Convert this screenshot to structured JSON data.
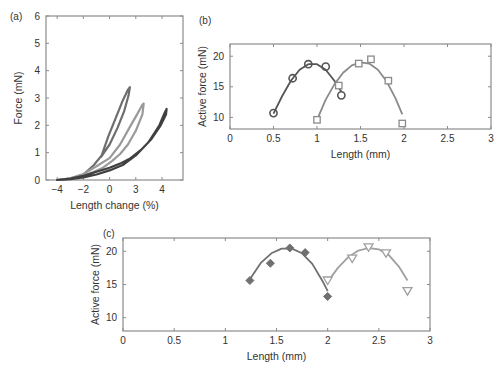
{
  "figure": {
    "panels": [
      {
        "label": "(a)"
      },
      {
        "label": "(b)"
      },
      {
        "label": "(c)"
      }
    ]
  },
  "chart_data": [
    {
      "panel": "(a)",
      "type": "line",
      "title": "",
      "xlabel": "Length change (%)",
      "ylabel": "Force (mN)",
      "xlim": [
        -4.85,
        5.6
      ],
      "ylim": [
        0,
        6
      ],
      "xticks": [
        -4,
        -2,
        0,
        2,
        4
      ],
      "xtick_labels": [
        "-4",
        "-2",
        "0",
        "3",
        "4"
      ],
      "yticks": [
        0,
        1,
        2,
        3,
        4,
        5,
        6
      ],
      "ytick_labels": [
        "0",
        "1",
        "2",
        "3",
        "4",
        "5",
        "6"
      ],
      "grid": false,
      "legend": null,
      "series": [
        {
          "name": "loop 1",
          "color": "#6e6e6e",
          "points": [
            [
              -4,
              0
            ],
            [
              -3,
              0.05
            ],
            [
              -2,
              0.2
            ],
            [
              -1.2,
              0.55
            ],
            [
              -0.6,
              0.9
            ],
            [
              -0.1,
              1.6
            ],
            [
              0.5,
              2.3
            ],
            [
              1.0,
              2.9
            ],
            [
              1.4,
              3.3
            ],
            [
              1.55,
              3.4
            ],
            [
              1.45,
              3.1
            ],
            [
              1.1,
              2.5
            ],
            [
              0.6,
              1.9
            ],
            [
              0.0,
              1.3
            ],
            [
              -0.5,
              0.95
            ],
            [
              -0.65,
              0.85
            ]
          ]
        },
        {
          "name": "loop 2",
          "color": "#9a9a9a",
          "points": [
            [
              -4,
              0
            ],
            [
              -3,
              0.06
            ],
            [
              -2,
              0.22
            ],
            [
              -1,
              0.5
            ],
            [
              0,
              0.8
            ],
            [
              0.8,
              1.3
            ],
            [
              1.5,
              1.9
            ],
            [
              2.1,
              2.4
            ],
            [
              2.5,
              2.75
            ],
            [
              2.6,
              2.8
            ],
            [
              2.5,
              2.4
            ],
            [
              2.0,
              1.8
            ],
            [
              1.4,
              1.3
            ],
            [
              0.8,
              0.95
            ],
            [
              0.2,
              0.7
            ],
            [
              -0.5,
              0.45
            ],
            [
              -1.2,
              0.3
            ],
            [
              -2,
              0.15
            ],
            [
              -3,
              0.05
            ],
            [
              -4,
              0
            ]
          ]
        },
        {
          "name": "loop 3",
          "color": "#404040",
          "points": [
            [
              -4,
              0
            ],
            [
              -3,
              0.03
            ],
            [
              -2,
              0.1
            ],
            [
              -1,
              0.2
            ],
            [
              0,
              0.35
            ],
            [
              1,
              0.55
            ],
            [
              2,
              0.9
            ],
            [
              3,
              1.4
            ],
            [
              3.8,
              2.0
            ],
            [
              4.2,
              2.45
            ],
            [
              4.35,
              2.6
            ],
            [
              4.3,
              2.4
            ],
            [
              3.9,
              2.0
            ],
            [
              3.2,
              1.5
            ],
            [
              2.4,
              1.1
            ],
            [
              1.6,
              0.8
            ],
            [
              0.8,
              0.6
            ],
            [
              0,
              0.45
            ],
            [
              -1,
              0.3
            ],
            [
              -2,
              0.15
            ],
            [
              -3,
              0.05
            ],
            [
              -4,
              0
            ]
          ]
        }
      ]
    },
    {
      "panel": "(b)",
      "type": "scatter",
      "title": "",
      "xlabel": "Length (mm)",
      "ylabel": "Active force (mN)",
      "xlim": [
        0,
        3
      ],
      "ylim": [
        8.1,
        22.0
      ],
      "xticks": [
        0,
        0.5,
        1,
        1.5,
        2,
        2.5,
        3
      ],
      "xtick_labels": [
        "0",
        "0.5",
        "1",
        "1.5",
        "2",
        "2.5",
        "3"
      ],
      "yticks": [
        10,
        15,
        20
      ],
      "ytick_labels": [
        "10",
        "15",
        "20"
      ],
      "grid": false,
      "legend": null,
      "series": [
        {
          "name": "circles",
          "marker": "circle",
          "color": "#555555",
          "x": [
            0.5,
            0.72,
            0.9,
            1.1,
            1.28
          ],
          "y": [
            10.7,
            16.4,
            18.7,
            18.3,
            13.6
          ],
          "fit": [
            [
              0.5,
              10.6
            ],
            [
              0.6,
              13.5
            ],
            [
              0.7,
              16.0
            ],
            [
              0.8,
              17.8
            ],
            [
              0.9,
              18.7
            ],
            [
              1.0,
              18.7
            ],
            [
              1.1,
              17.8
            ],
            [
              1.2,
              16.0
            ],
            [
              1.28,
              14.2
            ]
          ]
        },
        {
          "name": "squares",
          "marker": "square",
          "color": "#8a8a8a",
          "x": [
            1.0,
            1.25,
            1.48,
            1.62,
            1.82,
            1.98
          ],
          "y": [
            9.6,
            15.2,
            18.8,
            19.5,
            16.0,
            9.0
          ],
          "fit": [
            [
              1.0,
              9.6
            ],
            [
              1.1,
              12.9
            ],
            [
              1.2,
              15.4
            ],
            [
              1.3,
              17.3
            ],
            [
              1.4,
              18.5
            ],
            [
              1.5,
              19.0
            ],
            [
              1.6,
              18.8
            ],
            [
              1.7,
              17.8
            ],
            [
              1.8,
              15.9
            ],
            [
              1.9,
              13.2
            ],
            [
              1.98,
              10.5
            ]
          ]
        }
      ]
    },
    {
      "panel": "(c)",
      "type": "scatter",
      "title": "",
      "xlabel": "Length (mm)",
      "ylabel": "Active force (mN)",
      "xlim": [
        0,
        3
      ],
      "ylim": [
        8.0,
        22.0
      ],
      "xticks": [
        0,
        0.5,
        1,
        1.5,
        2,
        2.5,
        3
      ],
      "xtick_labels": [
        "0",
        "0.5",
        "1",
        "1.5",
        "2",
        "2.5",
        "3"
      ],
      "yticks": [
        10,
        15,
        20
      ],
      "ytick_labels": [
        "10",
        "15",
        "20"
      ],
      "grid": false,
      "legend": null,
      "series": [
        {
          "name": "diamonds",
          "marker": "diamond",
          "color": "#707070",
          "x": [
            1.24,
            1.44,
            1.63,
            1.78,
            2.0
          ],
          "y": [
            15.6,
            18.2,
            20.5,
            19.8,
            13.2
          ],
          "fit": [
            [
              1.24,
              15.8
            ],
            [
              1.35,
              18.3
            ],
            [
              1.45,
              19.7
            ],
            [
              1.55,
              20.4
            ],
            [
              1.65,
              20.4
            ],
            [
              1.75,
              19.7
            ],
            [
              1.85,
              18.1
            ],
            [
              1.95,
              15.5
            ],
            [
              2.0,
              14.0
            ]
          ]
        },
        {
          "name": "triangles",
          "marker": "triangle-down",
          "color": "#a0a0a0",
          "x": [
            2.0,
            2.24,
            2.4,
            2.57,
            2.78
          ],
          "y": [
            15.6,
            18.9,
            20.6,
            19.7,
            14.0
          ],
          "fit": [
            [
              2.0,
              15.4
            ],
            [
              2.1,
              17.5
            ],
            [
              2.2,
              19.1
            ],
            [
              2.3,
              20.1
            ],
            [
              2.4,
              20.5
            ],
            [
              2.5,
              20.3
            ],
            [
              2.6,
              19.4
            ],
            [
              2.7,
              17.6
            ],
            [
              2.78,
              15.6
            ]
          ]
        }
      ]
    }
  ],
  "layout": {
    "panels": [
      {
        "frame": [
          46,
          16,
          183,
          180
        ],
        "label_pos": [
          10,
          20
        ]
      },
      {
        "frame": [
          230,
          44,
          491,
          129
        ],
        "label_pos": [
          199,
          24
        ]
      },
      {
        "frame": [
          123,
          238,
          430,
          331
        ],
        "label_pos": [
          103,
          237
        ]
      }
    ]
  }
}
